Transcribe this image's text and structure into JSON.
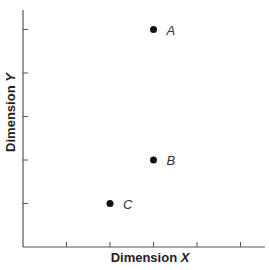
{
  "chart_data": {
    "type": "scatter",
    "title": "",
    "xlabel": "Dimension X",
    "ylabel": "Dimension Y",
    "xlim": [
      0,
      5.5
    ],
    "ylim": [
      0,
      5.5
    ],
    "grid": false,
    "legend": null,
    "x_ticks": [
      1,
      2,
      3,
      4,
      5
    ],
    "y_ticks": [
      1,
      2,
      3,
      4,
      5
    ],
    "tick_labels_shown": false,
    "points": [
      {
        "label": "A",
        "x": 3,
        "y": 5
      },
      {
        "label": "B",
        "x": 3,
        "y": 2
      },
      {
        "label": "C",
        "x": 2,
        "y": 1
      }
    ],
    "colors": {
      "axis": "#555555",
      "point": "#111111",
      "label": "#333333"
    }
  },
  "labels": {
    "x_prefix": "Dimension ",
    "x_var": "X",
    "y_prefix": "Dimension ",
    "y_var": "Y"
  }
}
